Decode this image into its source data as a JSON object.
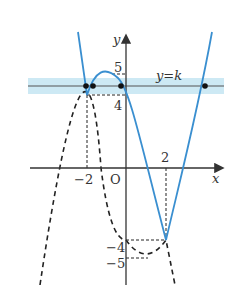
{
  "diagram": {
    "type": "function-graph",
    "axes": {
      "x_label": "x",
      "y_label": "y",
      "origin_label": "O"
    },
    "tick_labels": {
      "x_neg2": "−2",
      "x_2": "2",
      "y_5": "5",
      "y_4": "4",
      "y_neg4": "−4",
      "y_neg5": "−5"
    },
    "horizontal_line_label": "y=k",
    "colors": {
      "curve": "#3a8fd0",
      "band": "#cde9f4",
      "axis": "#333333",
      "dashed": "#222222"
    },
    "marked_points_on_line_y_eq_k": 4
  }
}
